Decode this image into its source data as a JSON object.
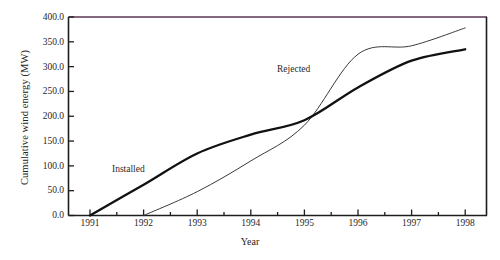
{
  "chart_data": {
    "type": "line",
    "title": "",
    "xlabel": "Year",
    "ylabel": "Cumulative wind energy (MW)",
    "xlim": [
      1991,
      1998
    ],
    "ylim": [
      0,
      400
    ],
    "xticks": [
      "1991",
      "1992",
      "1993",
      "1994",
      "1995",
      "1996",
      "1997",
      "1998"
    ],
    "yticks": [
      "0.0",
      "50.0",
      "100.0",
      "150.0",
      "200.0",
      "250.0",
      "300.0",
      "350.0",
      "400.0"
    ],
    "grid": false,
    "legend_position": "inline-annotations",
    "x": [
      1991,
      1992,
      1993,
      1994,
      1995,
      1996,
      1997,
      1998
    ],
    "series": [
      {
        "name": "Installed",
        "style": "thick-black",
        "color": "#111111",
        "values": [
          0,
          62,
          125,
          163,
          192,
          258,
          312,
          335
        ]
      },
      {
        "name": "Rejected",
        "style": "thin-black",
        "color": "#3a3a3a",
        "values": [
          0,
          0,
          48,
          110,
          182,
          325,
          342,
          378
        ]
      }
    ],
    "annotations": [
      {
        "text": "Installed",
        "x": 1992.4,
        "y": 118
      },
      {
        "text": "Rejected",
        "x": 1994.9,
        "y": 262
      }
    ]
  },
  "axes": {
    "ylabel": "Cumulative wind energy (MW)",
    "xlabel": "Year",
    "yticks": [
      "400.0",
      "350.0",
      "300.0",
      "250.0",
      "200.0",
      "150.0",
      "100.0",
      "50.0",
      "0.0"
    ],
    "xticks": [
      "1991",
      "1992",
      "1993",
      "1994",
      "1995",
      "1996",
      "1997",
      "1998"
    ]
  },
  "labels": {
    "installed": "Installed",
    "rejected": "Rejected"
  },
  "caption": {
    "text": ""
  },
  "colors": {
    "axis": "#1d1d1d",
    "installed_line": "#111111",
    "rejected_line": "#3a3a3a",
    "background": "#ffffff",
    "text": "#232323"
  }
}
